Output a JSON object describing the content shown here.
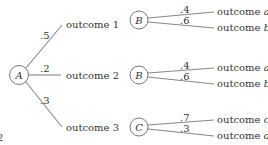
{
  "tree": {
    "root": {
      "label": "A"
    },
    "branches": [
      {
        "prob": ".5",
        "outcome": "outcome 1"
      },
      {
        "prob": ".2",
        "outcome": "outcome 2"
      },
      {
        "prob": ".3",
        "outcome": "outcome 3"
      }
    ],
    "subtrees": [
      {
        "node": "B",
        "branches": [
          {
            "prob": ".4",
            "outcome_prefix": "outcome ",
            "outcome_var": "a"
          },
          {
            "prob": ".6",
            "outcome_prefix": "outcome ",
            "outcome_var": "b"
          }
        ]
      },
      {
        "node": "B",
        "branches": [
          {
            "prob": ".4",
            "outcome_prefix": "outcome ",
            "outcome_var": "a"
          },
          {
            "prob": ".6",
            "outcome_prefix": "outcome ",
            "outcome_var": "b"
          }
        ]
      },
      {
        "node": "C",
        "branches": [
          {
            "prob": ".7",
            "outcome_prefix": "outcome ",
            "outcome_var": "c"
          },
          {
            "prob": ".3",
            "outcome_prefix": "outcome ",
            "outcome_var": "d"
          }
        ]
      }
    ],
    "margin_mark": "2"
  }
}
